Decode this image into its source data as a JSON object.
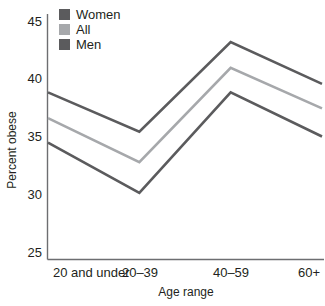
{
  "chart_data": {
    "type": "line",
    "title": "",
    "xlabel": "Age range",
    "ylabel": "Percent obese",
    "categories": [
      "20 and under",
      "20–39",
      "40–59",
      "60+"
    ],
    "series": [
      {
        "name": "Women",
        "values": [
          38.6,
          35.4,
          42.7,
          39.3
        ],
        "color": "#5b5b5d"
      },
      {
        "name": "All",
        "values": [
          36.5,
          32.9,
          40.6,
          37.3
        ],
        "color": "#a6a8ab"
      },
      {
        "name": "Men",
        "values": [
          34.5,
          30.4,
          38.6,
          35.0
        ],
        "color": "#5b5b5d"
      }
    ],
    "ylim": [
      25,
      45
    ],
    "yticks": [
      25,
      30,
      35,
      40,
      45
    ],
    "ytick_labels": [
      "25",
      "30",
      "35",
      "40",
      "45"
    ],
    "grid": false,
    "legend_position": "top-left-inside",
    "legend": [
      {
        "label": "Women",
        "color": "#5b5b5d"
      },
      {
        "label": "All",
        "color": "#a6a8ab"
      },
      {
        "label": "Men",
        "color": "#5b5b5d"
      }
    ]
  },
  "axis": {
    "y_title": "Percent obese",
    "x_title": "Age range"
  },
  "colors": {
    "axis": "#6d6e71",
    "text": "#231f20",
    "series_dark": "#5b5b5d",
    "series_light": "#a6a8ab",
    "background": "#ffffff"
  }
}
